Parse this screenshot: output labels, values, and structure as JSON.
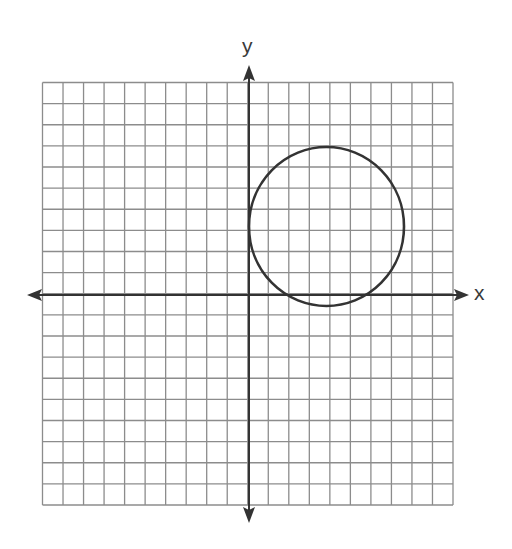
{
  "diagram": {
    "type": "coordinate-plane",
    "x_axis_label": "x",
    "y_axis_label": "y",
    "grid": {
      "columns": 20,
      "rows": 20,
      "x_range": [
        -10,
        10
      ],
      "y_range": [
        -10,
        10
      ],
      "line_color": "#8c8c8c",
      "axis_color": "#333333"
    },
    "shapes": [
      {
        "type": "circle",
        "center": [
          3.75,
          3.25
        ],
        "radius": 3.75,
        "stroke": "#333333",
        "note": "Circle in quadrant I, tangent to the y-axis, dipping slightly below the x-axis"
      }
    ]
  }
}
